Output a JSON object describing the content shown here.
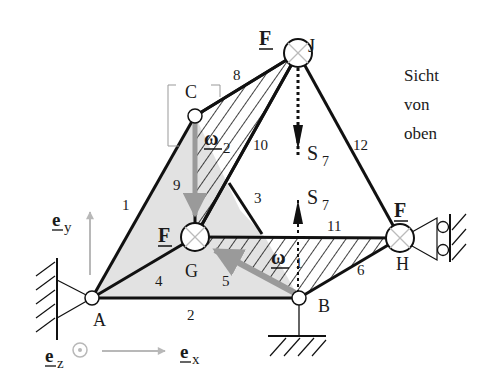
{
  "nodes": {
    "A": "A",
    "B": "B",
    "C": "C",
    "G": "G",
    "H": "H",
    "J": "J"
  },
  "members": [
    "1",
    "2",
    "3",
    "4",
    "5",
    "6",
    "8",
    "9",
    "10",
    "11",
    "12"
  ],
  "forces": {
    "F_J": "F",
    "F_G": "F",
    "F_H": "F"
  },
  "omega": {
    "sym": "ω",
    "w1_sub": "1",
    "w2_sub": "2"
  },
  "s7": {
    "sym": "S",
    "sub": "7"
  },
  "axes": {
    "e": "e",
    "x": "x",
    "y": "y",
    "z": "z"
  },
  "view_note": [
    "Sicht",
    "von",
    "oben"
  ],
  "colors": {
    "line": "#111111",
    "shade": "#e2e2e2",
    "gray_arrow": "#9a9a9a",
    "light_arrow": "#b5b5b5"
  }
}
